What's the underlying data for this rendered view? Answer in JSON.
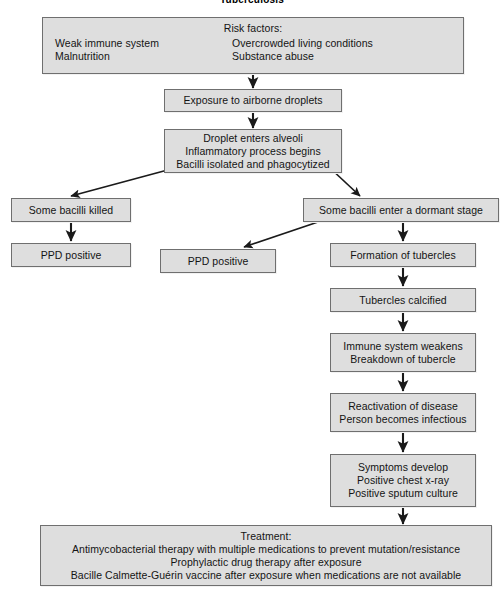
{
  "title": "Tuberculosis",
  "colors": {
    "box_fill": "#dedede",
    "box_border": "#6f6f6f",
    "arrow": "#1a1a1a",
    "page_background": "#ffffff",
    "text": "#141414"
  },
  "nodes": {
    "risk_factors": {
      "heading": "Risk factors:",
      "left_column": [
        "Weak immune system",
        "Malnutrition"
      ],
      "right_column": [
        "Overcrowded living conditions",
        "Substance abuse"
      ]
    },
    "exposure": {
      "lines": [
        "Exposure to airborne droplets"
      ]
    },
    "droplet_alveoli": {
      "lines": [
        "Droplet enters alveoli",
        "Inflammatory process begins",
        "Bacilli isolated and phagocytized"
      ]
    },
    "bacilli_killed": {
      "lines": [
        "Some bacilli killed"
      ]
    },
    "ppd_positive_left": {
      "lines": [
        "PPD positive"
      ]
    },
    "dormant_stage": {
      "lines": [
        "Some bacilli enter a dormant stage"
      ]
    },
    "ppd_positive_middle": {
      "lines": [
        "PPD positive"
      ]
    },
    "formation_tubercles": {
      "lines": [
        "Formation of tubercles"
      ]
    },
    "tubercles_calcified": {
      "lines": [
        "Tubercles calcified"
      ]
    },
    "immune_weakens": {
      "lines": [
        "Immune system weakens",
        "Breakdown of tubercle"
      ]
    },
    "reactivation": {
      "lines": [
        "Reactivation of disease",
        "Person becomes infectious"
      ]
    },
    "symptoms": {
      "lines": [
        "Symptoms develop",
        "Positive chest x-ray",
        "Positive sputum culture"
      ]
    },
    "treatment": {
      "lines": [
        "Treatment:",
        "Antimycobacterial therapy with multiple medications to prevent mutation/resistance",
        "Prophylactic drug therapy after exposure",
        "Bacille Calmette-Guérin vaccine after exposure when medications are not available"
      ]
    }
  },
  "connectors": [
    {
      "name": "risk-factors-to-exposure",
      "kind": "vertical-arrow"
    },
    {
      "name": "exposure-to-droplet",
      "kind": "vertical-arrow"
    },
    {
      "name": "droplet-to-bacilli-killed",
      "kind": "diagonal-arrow"
    },
    {
      "name": "droplet-to-dormant-stage",
      "kind": "diagonal-arrow"
    },
    {
      "name": "bacilli-killed-to-ppd-positive",
      "kind": "vertical-arrow"
    },
    {
      "name": "dormant-stage-to-ppd-positive",
      "kind": "diagonal-arrow"
    },
    {
      "name": "dormant-stage-to-formation",
      "kind": "vertical-arrow"
    },
    {
      "name": "formation-to-calcified",
      "kind": "vertical-arrow"
    },
    {
      "name": "calcified-to-immune-weakens",
      "kind": "vertical-arrow"
    },
    {
      "name": "immune-weakens-to-reactivation",
      "kind": "vertical-arrow"
    },
    {
      "name": "reactivation-to-symptoms",
      "kind": "vertical-arrow"
    },
    {
      "name": "symptoms-to-treatment",
      "kind": "vertical-arrow"
    }
  ]
}
